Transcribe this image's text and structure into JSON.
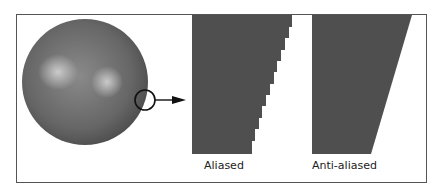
{
  "diagram": {
    "type": "anti-aliasing illustration",
    "sphere": {
      "label": "",
      "highlight_count": 2
    },
    "magnifier": {
      "shape": "circle",
      "points_to": "zoomed edges"
    },
    "panels": [
      {
        "label": "Aliased",
        "edge": "stepped"
      },
      {
        "label": "Anti-aliased",
        "edge": "smooth"
      }
    ],
    "colors": {
      "fill": "#4f4f4f",
      "sphere_base": "#6a6a6a",
      "sphere_highlight": "#c9c9c9",
      "frame": "#555555",
      "background": "#ffffff"
    }
  }
}
